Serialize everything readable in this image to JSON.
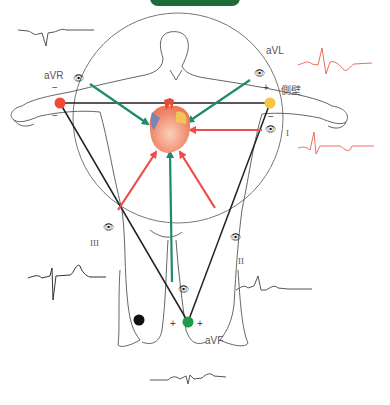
{
  "header": {
    "tag_label": ""
  },
  "leads": {
    "aVR": {
      "label": "aVR"
    },
    "aVL": {
      "label": "aVL",
      "region": "側壁"
    },
    "I": {
      "label": "I"
    },
    "II": {
      "label": "II"
    },
    "III": {
      "label": "III"
    },
    "aVF": {
      "label": "aVF"
    }
  },
  "signs": {
    "plus": "+",
    "minus": "−"
  },
  "icons": {
    "eye": "eye-icon"
  },
  "colors": {
    "augmented_arrow": "#1f8a6e",
    "limb_arrow": "#ee4b4b",
    "right_arm_electrode": "#f04a35",
    "left_arm_electrode": "#f6c643",
    "left_leg_electrode": "#1e9a4a",
    "right_leg_electrode": "#111111",
    "ecg_red": "#e8705f",
    "ecg_gray": "#555555",
    "tag_green": "#1e6b3a"
  }
}
